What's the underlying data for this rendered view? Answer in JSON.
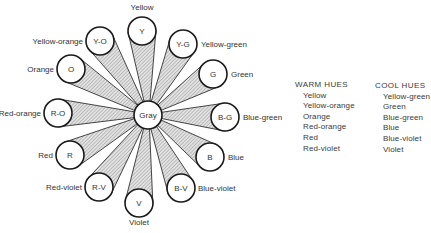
{
  "diagram": {
    "center": {
      "abbr": "Gray",
      "x": 148,
      "y": 115,
      "r": 14
    },
    "hues": [
      {
        "abbr": "Y",
        "name": "Yellow",
        "x": 142,
        "y": 31,
        "lx": 142,
        "ly": 10,
        "anchor": "middle"
      },
      {
        "abbr": "Y-G",
        "name": "Yellow-green",
        "x": 183,
        "y": 44,
        "lx": 201,
        "ly": 47,
        "anchor": "start"
      },
      {
        "abbr": "G",
        "name": "Green",
        "x": 213,
        "y": 74,
        "lx": 231,
        "ly": 77,
        "anchor": "start"
      },
      {
        "abbr": "B-G",
        "name": "Blue-green",
        "x": 225,
        "y": 117,
        "lx": 243,
        "ly": 120,
        "anchor": "start"
      },
      {
        "abbr": "B",
        "name": "Blue",
        "x": 210,
        "y": 157,
        "lx": 228,
        "ly": 160,
        "anchor": "start"
      },
      {
        "abbr": "B-V",
        "name": "Blue-violet",
        "x": 181,
        "y": 188,
        "lx": 198,
        "ly": 191,
        "anchor": "start"
      },
      {
        "abbr": "V",
        "name": "Violet",
        "x": 139,
        "y": 203,
        "lx": 139,
        "ly": 225,
        "anchor": "middle"
      },
      {
        "abbr": "R-V",
        "name": "Red-violet",
        "x": 99,
        "y": 187,
        "lx": 82,
        "ly": 190,
        "anchor": "end"
      },
      {
        "abbr": "R",
        "name": "Red",
        "x": 70,
        "y": 155,
        "lx": 53,
        "ly": 158,
        "anchor": "end"
      },
      {
        "abbr": "R-O",
        "name": "Red-orange",
        "x": 58,
        "y": 113,
        "lx": 41,
        "ly": 116,
        "anchor": "end"
      },
      {
        "abbr": "O",
        "name": "Orange",
        "x": 71,
        "y": 69,
        "lx": 54,
        "ly": 72,
        "anchor": "end"
      },
      {
        "abbr": "Y-O",
        "name": "Yellow-orange",
        "x": 100,
        "y": 41,
        "lx": 83,
        "ly": 44,
        "anchor": "end"
      }
    ],
    "circle_radius": 14,
    "colors": {
      "stroke": "#1a1a1a",
      "wedge_fill": "#d8d8d8",
      "hatch": "#9a9a9a",
      "text": "#333333"
    }
  },
  "legend": {
    "warm": {
      "title": "WARM HUES",
      "items": [
        "Yellow",
        "Yellow-orange",
        "Orange",
        "Red-orange",
        "Red",
        "Red-violet"
      ]
    },
    "cool": {
      "title": "COOL HUES",
      "items": [
        "Yellow-green",
        "Green",
        "Blue-green",
        "Blue",
        "Blue-violet",
        "Violet"
      ]
    }
  }
}
